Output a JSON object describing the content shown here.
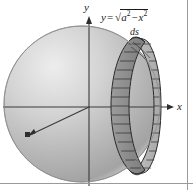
{
  "figure": {
    "kind": "sphere-surface-area-diagram",
    "axes": {
      "y_label": "y",
      "x_label": "x",
      "origin": {
        "x": 89,
        "y": 107
      },
      "x_axis_from": {
        "x": 3,
        "y": 107
      },
      "x_axis_to": {
        "x": 174,
        "y": 107
      },
      "y_axis_from": {
        "x": 89,
        "y": 186
      },
      "y_axis_to": {
        "x": 89,
        "y": 17
      },
      "axis_color": "#3a3a3a"
    },
    "equation": {
      "lhs": "y",
      "equals": "=",
      "radical": "√",
      "term_a": "a",
      "exp_a": "2",
      "minus": "−",
      "term_x": "x",
      "exp_x": "2",
      "full_text": "y = √(a² − x²)"
    },
    "arc_element_label": "ds",
    "sphere": {
      "center": {
        "x": 82,
        "y": 104
      },
      "radius": 78,
      "fill_light": "#e2e2e2",
      "fill_mid": "#b9b9b9",
      "fill_dark": "#9a9a9a",
      "outline": "#8a8a8a"
    },
    "band": {
      "description": "vertical annular strip (ring) cut from the sphere, drawn in perspective with horizontal subdivision segments",
      "segment_count": 14,
      "near_face_fill": "#8f8f8f",
      "far_face_fill": "#b5b5b5",
      "stroke": "#2b2b2b"
    },
    "radius_arrow": {
      "from": {
        "x": 89,
        "y": 107
      },
      "to": {
        "x": 29,
        "y": 136
      },
      "color": "#3a3a3a"
    },
    "page_border": {
      "right_rule_x": 187,
      "bottom_rule_y": 183,
      "color": "#9a9a9a"
    },
    "colors": {
      "ink": "#1a1a1a",
      "background": "#ffffff"
    }
  }
}
